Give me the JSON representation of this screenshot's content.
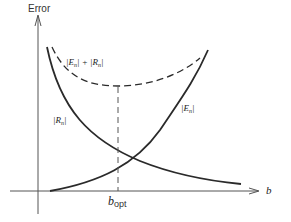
{
  "diagram": {
    "y_axis_label": "Error",
    "x_axis_label": "b",
    "optimum_label_main": "b",
    "optimum_label_sub": "opt",
    "curves": [
      {
        "name": "|E_n| + |R_n|",
        "style": "dashed",
        "label_parts": [
          "|E",
          "n",
          "| + |R",
          "n",
          "|"
        ]
      },
      {
        "name": "|E_n|",
        "style": "solid",
        "label_parts": [
          "|E",
          "n",
          "|"
        ]
      },
      {
        "name": "|R_n|",
        "style": "solid",
        "label_parts": [
          "|R",
          "n",
          "|"
        ]
      }
    ],
    "colors": {
      "line": "#2a2a2a",
      "axis": "#555555",
      "background": "#ffffff"
    }
  }
}
